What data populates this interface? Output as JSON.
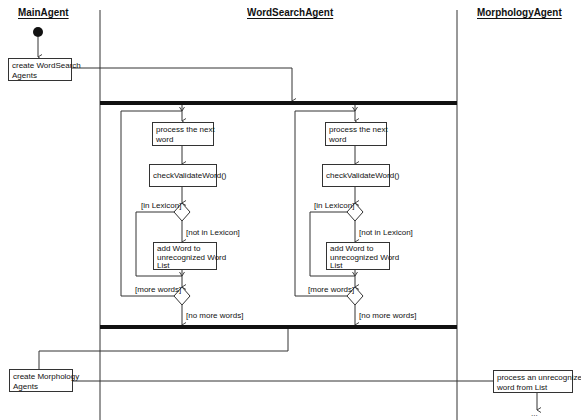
{
  "diagram": {
    "type": "UML activity diagram with swimlanes",
    "swimlanes": [
      {
        "id": "main",
        "title": "MainAgent"
      },
      {
        "id": "wordsearch",
        "title": "WordSearchAgent"
      },
      {
        "id": "morphology",
        "title": "MorphologyAgent"
      }
    ],
    "nodes": {
      "create_ws": {
        "label_line1": "create WordSearch",
        "label_line2": "Agents"
      },
      "left_process": {
        "label_line1": "process the next",
        "label_line2": "word"
      },
      "left_check": {
        "label": "checkValidateWord()"
      },
      "left_add": {
        "label_line1": "add Word to",
        "label_line2": "unrecognized Word",
        "label_line3": "List"
      },
      "right_process": {
        "label_line1": "process the next",
        "label_line2": "word"
      },
      "right_check": {
        "label": "checkValidateWord()"
      },
      "right_add": {
        "label_line1": "add Word to",
        "label_line2": "unrecognized Word",
        "label_line3": "List"
      },
      "create_morph": {
        "label_line1": "create Morphology",
        "label_line2": "Agents"
      },
      "process_unrec": {
        "label_line1": "process an unrecognized",
        "label_line2": "word from List"
      }
    },
    "guards": {
      "in_lexicon": "[in Lexicon]",
      "not_in_lexicon": "[not in Lexicon]",
      "more_words": "[more words]",
      "no_more_words": "[no more words]"
    },
    "continuation": "..."
  }
}
